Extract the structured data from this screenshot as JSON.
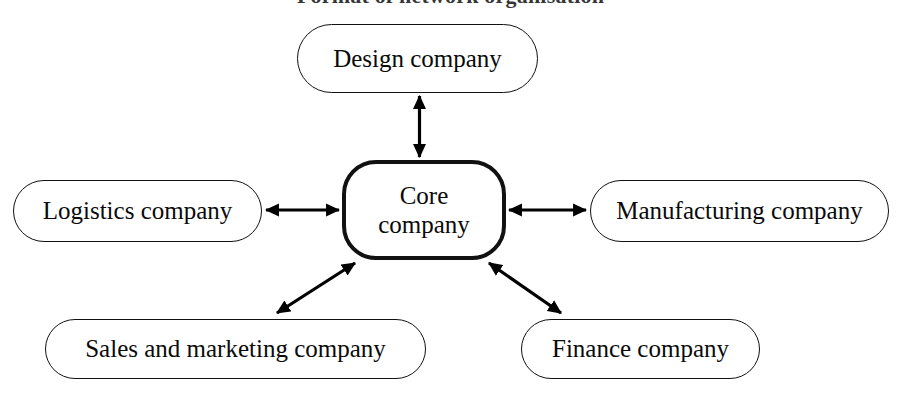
{
  "figure": {
    "title": "Format of network organisation",
    "type": "hub-and-spoke network diagram",
    "background_color": "#ffffff",
    "ink_color": "#000000"
  },
  "nodes": {
    "core": {
      "label": "Core\ncompany",
      "label_line1": "Core",
      "label_line2": "company",
      "emphasis": "bold-border"
    },
    "design": {
      "label": "Design company"
    },
    "logistics": {
      "label": "Logistics company"
    },
    "manufacturing": {
      "label": "Manufacturing company"
    },
    "sales": {
      "label": "Sales and marketing company"
    },
    "finance": {
      "label": "Finance company"
    }
  },
  "connections": [
    {
      "name": "core-design",
      "from": "Core company",
      "to": "Design company",
      "direction": "bidirectional",
      "orientation": "vertical"
    },
    {
      "name": "core-logistics",
      "from": "Core company",
      "to": "Logistics company",
      "direction": "bidirectional",
      "orientation": "horizontal"
    },
    {
      "name": "core-manufacturing",
      "from": "Core company",
      "to": "Manufacturing company",
      "direction": "bidirectional",
      "orientation": "horizontal"
    },
    {
      "name": "core-sales",
      "from": "Core company",
      "to": "Sales and marketing company",
      "direction": "bidirectional",
      "orientation": "diagonal-down-left"
    },
    {
      "name": "core-finance",
      "from": "Core company",
      "to": "Finance company",
      "direction": "bidirectional",
      "orientation": "diagonal-down-right"
    }
  ]
}
